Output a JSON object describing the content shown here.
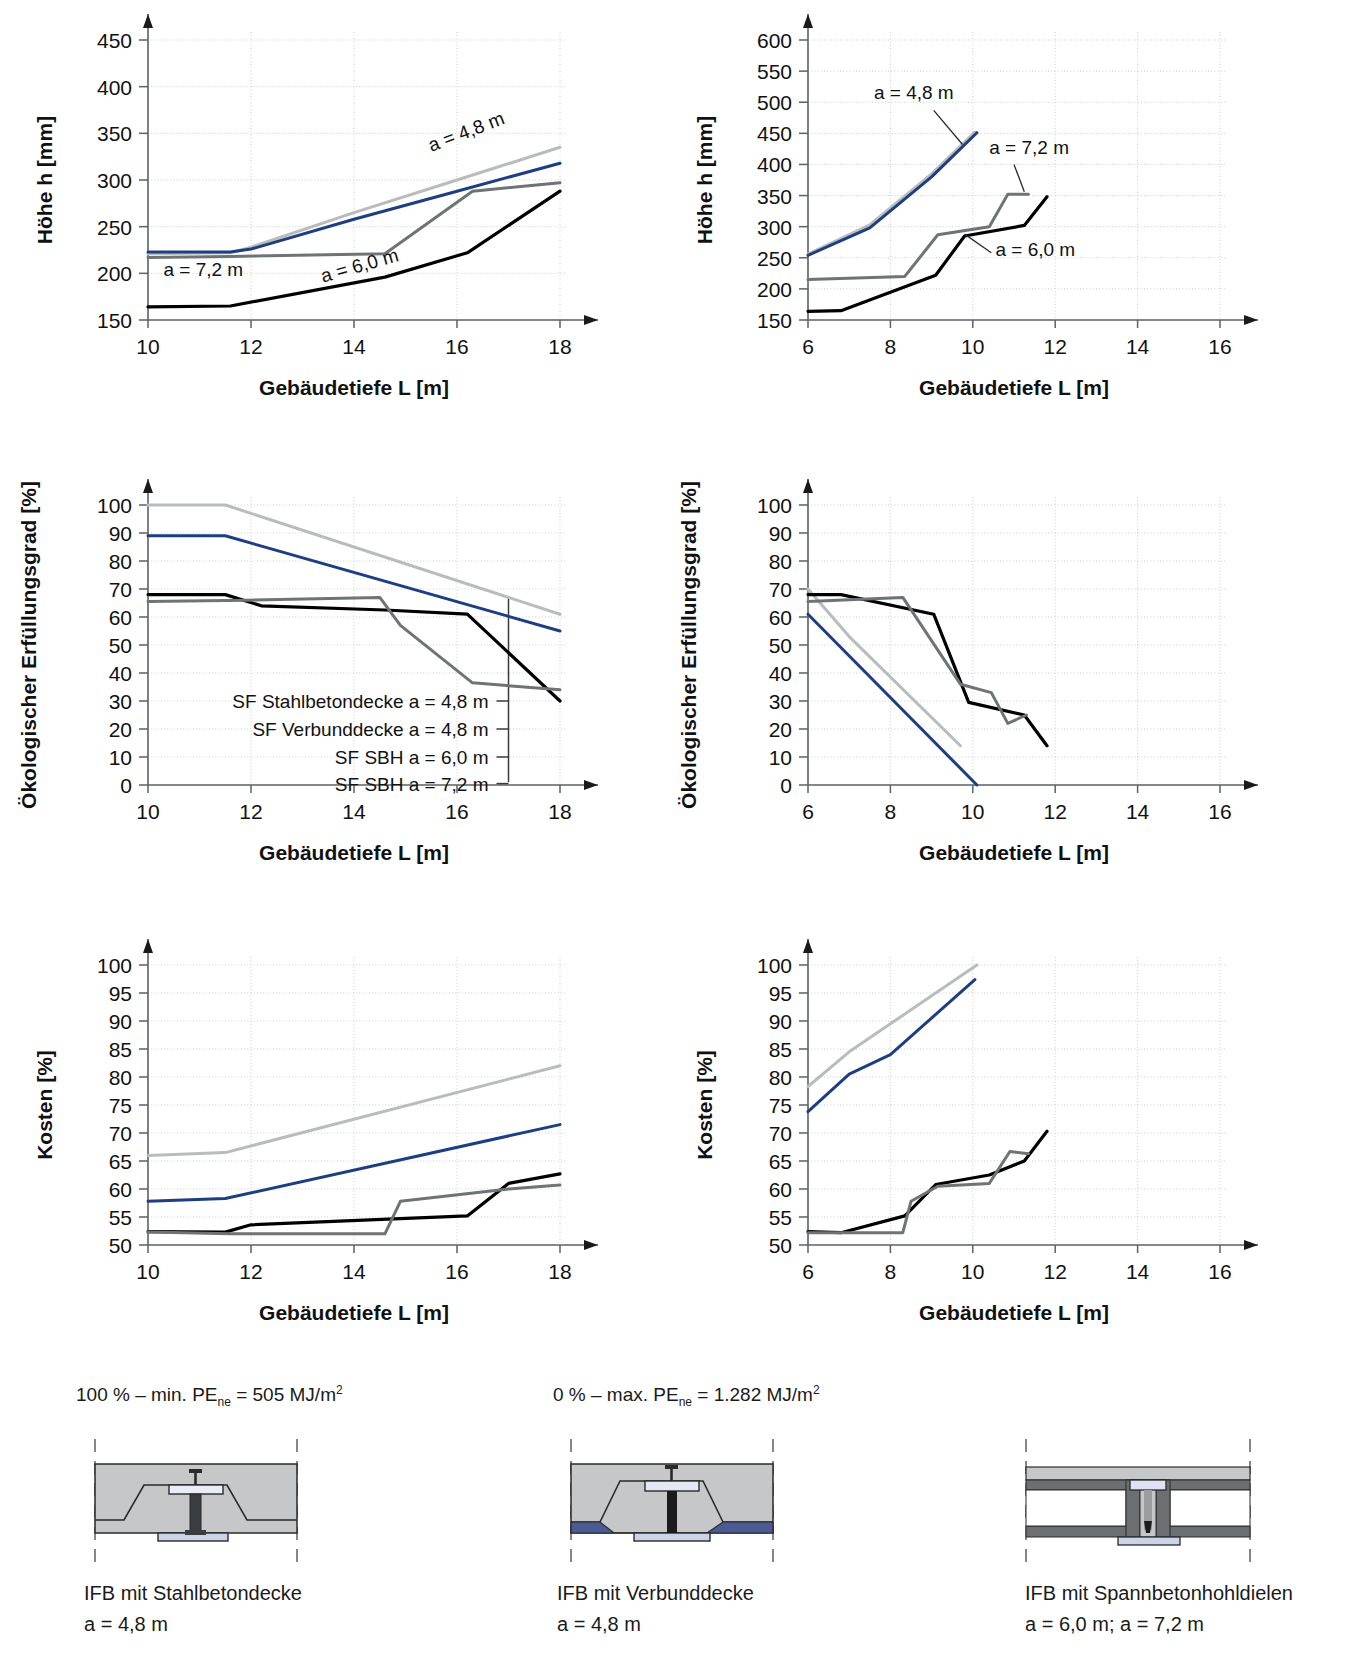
{
  "figure": {
    "notes": [
      {
        "text_html": "100 % &#8211; min. PE<sub>ne</sub> = 505 MJ/m<sup>2</sup>",
        "plain": "100% - min. PEne = 505 MJ/m2"
      },
      {
        "text_html": "0 % &#8211; max. PE<sub>ne</sub> = 1.282 MJ/m<sup>2</sup>",
        "plain": "0% - max. PEne = 1.282 MJ/m2"
      }
    ]
  },
  "colors": {
    "series_stahlbeton": "#b9bcbd",
    "series_verbund": "#1d3e80",
    "series_sbh60": "#000000",
    "series_sbh72": "#6e7375",
    "grid": "#c8cdd2",
    "axis": "#5c6164",
    "concrete": "#c6c7c9",
    "steel_dark": "#6b6f72",
    "composite_blue": "#4a5a92",
    "flange_blue": "#ccd3e8"
  },
  "legend": {
    "items": [
      {
        "label": "SF Stahlbetondecke a = 4,8 m"
      },
      {
        "label": "SF Verbunddecke a = 4,8 m"
      },
      {
        "label": "SF SBH a = 6,0 m"
      },
      {
        "label": "SF SBH a = 7,2 m"
      }
    ]
  },
  "chart_data": [
    {
      "id": "hoehe-links",
      "type": "line",
      "title": "",
      "xlabel": "Gebäudetiefe L [m]",
      "ylabel": "Höhe h [mm]",
      "xlim": [
        10,
        18
      ],
      "ylim": [
        150,
        450
      ],
      "xticks": [
        10,
        12,
        14,
        16,
        18
      ],
      "yticks": [
        150,
        200,
        250,
        300,
        350,
        400,
        450
      ],
      "grid": true,
      "annotations": [
        {
          "text": "a = 4,8 m",
          "x": 15.5,
          "y": 330,
          "rot": -21
        },
        {
          "text": "a = 7,2 m",
          "x": 10.3,
          "y": 197,
          "rot": 0
        },
        {
          "text": "a = 6,0 m",
          "x": 13.4,
          "y": 190,
          "rot": -16
        }
      ],
      "series": [
        {
          "name": "SF Stahlbetondecke a = 4,8 m",
          "color_key": "series_stahlbeton",
          "x": [
            10,
            11.6,
            12,
            14,
            16,
            18
          ],
          "values": [
            221,
            222,
            228,
            265,
            300,
            335
          ]
        },
        {
          "name": "SF Verbunddecke a = 4,8 m",
          "color_key": "series_verbund",
          "x": [
            10,
            11.6,
            12,
            14,
            16,
            18
          ],
          "values": [
            223,
            223,
            226,
            258,
            288,
            318
          ]
        },
        {
          "name": "SF SBH a = 7,2 m",
          "color_key": "series_sbh72",
          "x": [
            10,
            11.6,
            14.6,
            16.3,
            18
          ],
          "values": [
            217,
            218,
            221,
            288,
            297
          ]
        },
        {
          "name": "SF SBH a = 6,0 m",
          "color_key": "series_sbh60",
          "x": [
            10,
            11.6,
            14.6,
            16.2,
            18
          ],
          "values": [
            164,
            165,
            196,
            222,
            288
          ]
        }
      ]
    },
    {
      "id": "hoehe-rechts",
      "type": "line",
      "title": "",
      "xlabel": "Gebäudetiefe L [m]",
      "ylabel": "Höhe h [mm]",
      "xlim": [
        6,
        16
      ],
      "ylim": [
        150,
        600
      ],
      "xticks": [
        6,
        8,
        10,
        12,
        14,
        16
      ],
      "yticks": [
        150,
        200,
        250,
        300,
        350,
        400,
        450,
        500,
        550,
        600
      ],
      "grid": true,
      "annotations": [
        {
          "text": "a = 4,8 m",
          "x": 7.6,
          "y": 505,
          "rot": 0,
          "leader": [
            [
              9.05,
              487
            ],
            [
              9.75,
              432
            ]
          ]
        },
        {
          "text": "a = 7,2 m",
          "x": 10.4,
          "y": 417,
          "rot": 0,
          "leader": [
            [
              11.0,
              400
            ],
            [
              11.25,
              356
            ]
          ]
        },
        {
          "text": "a = 6,0 m",
          "x": 10.55,
          "y": 253,
          "rot": 0,
          "leader": [
            [
              10.45,
              258
            ],
            [
              9.8,
              288
            ]
          ]
        }
      ],
      "series": [
        {
          "name": "SF Stahlbetondecke a = 4,8 m",
          "color_key": "series_stahlbeton",
          "x": [
            6,
            7.5,
            9,
            10.05
          ],
          "values": [
            256,
            303,
            385,
            452
          ]
        },
        {
          "name": "SF Verbunddecke a = 4,8 m",
          "color_key": "series_verbund",
          "x": [
            6,
            7.5,
            9,
            10.1
          ],
          "values": [
            254,
            298,
            380,
            451
          ]
        },
        {
          "name": "SF SBH a = 7,2 m",
          "color_key": "series_sbh72",
          "x": [
            6,
            8.35,
            9.15,
            10.4,
            10.85,
            11.35
          ],
          "values": [
            215,
            220,
            287,
            300,
            352,
            352
          ]
        },
        {
          "name": "SF SBH a = 6,0 m",
          "color_key": "series_sbh60",
          "x": [
            6,
            6.8,
            9.1,
            9.8,
            11.25,
            11.8
          ],
          "values": [
            164,
            165,
            222,
            285,
            302,
            348
          ]
        }
      ]
    },
    {
      "id": "oeko-links",
      "type": "line",
      "title": "",
      "xlabel": "Gebäudetiefe L [m]",
      "ylabel": "Ökologischer Erfüllungsgrad [%]",
      "xlim": [
        10,
        18
      ],
      "ylim": [
        0,
        100
      ],
      "xticks": [
        10,
        12,
        14,
        16,
        18
      ],
      "yticks": [
        0,
        10,
        20,
        30,
        40,
        50,
        60,
        70,
        80,
        90,
        100
      ],
      "grid": true,
      "legend_bracket_x": 17.0,
      "series": [
        {
          "name": "SF Stahlbetondecke a = 4,8 m",
          "color_key": "series_stahlbeton",
          "x": [
            10,
            11.5,
            18
          ],
          "values": [
            100,
            100,
            61
          ]
        },
        {
          "name": "SF Verbunddecke a = 4,8 m",
          "color_key": "series_verbund",
          "x": [
            10,
            11.5,
            18
          ],
          "values": [
            89,
            89,
            55
          ]
        },
        {
          "name": "SF SBH a = 6,0 m",
          "color_key": "series_sbh60",
          "x": [
            10,
            11.5,
            12.2,
            14.6,
            16.2,
            18
          ],
          "values": [
            68,
            68,
            64,
            62.5,
            61,
            30
          ]
        },
        {
          "name": "SF SBH a = 7,2 m",
          "color_key": "series_sbh72",
          "x": [
            10,
            11.9,
            14.5,
            14.9,
            16.3,
            18
          ],
          "values": [
            65.5,
            66,
            67,
            57,
            36.5,
            34
          ]
        }
      ]
    },
    {
      "id": "oeko-rechts",
      "type": "line",
      "title": "",
      "xlabel": "Gebäudetiefe L [m]",
      "ylabel": "Ökologischer Erfüllungsgrad [%]",
      "xlim": [
        6,
        16
      ],
      "ylim": [
        0,
        100
      ],
      "xticks": [
        6,
        8,
        10,
        12,
        14,
        16
      ],
      "yticks": [
        0,
        10,
        20,
        30,
        40,
        50,
        60,
        70,
        80,
        90,
        100
      ],
      "grid": true,
      "series": [
        {
          "name": "SF Stahlbetondecke a = 4,8 m",
          "color_key": "series_stahlbeton",
          "x": [
            6,
            7,
            9.7
          ],
          "values": [
            70,
            53,
            14
          ]
        },
        {
          "name": "SF Verbunddecke a = 4,8 m",
          "color_key": "series_verbund",
          "x": [
            6,
            10.1
          ],
          "values": [
            61,
            0
          ]
        },
        {
          "name": "SF SBH a = 6,0 m",
          "color_key": "series_sbh60",
          "x": [
            6,
            6.8,
            9.05,
            9.9,
            11.25,
            11.8
          ],
          "values": [
            68,
            68,
            61,
            29.5,
            25,
            14
          ]
        },
        {
          "name": "SF SBH a = 7,2 m",
          "color_key": "series_sbh72",
          "x": [
            6,
            8.3,
            9.7,
            10.45,
            10.85,
            11.3
          ],
          "values": [
            65.5,
            67,
            36,
            33,
            22,
            25
          ]
        }
      ]
    },
    {
      "id": "kosten-links",
      "type": "line",
      "title": "",
      "xlabel": "Gebäudetiefe L [m]",
      "ylabel": "Kosten [%]",
      "xlim": [
        10,
        18
      ],
      "ylim": [
        50,
        100
      ],
      "xticks": [
        10,
        12,
        14,
        16,
        18
      ],
      "yticks": [
        50,
        55,
        60,
        65,
        70,
        75,
        80,
        85,
        90,
        95,
        100
      ],
      "grid": true,
      "series": [
        {
          "name": "SF Stahlbetondecke a = 4,8 m",
          "color_key": "series_stahlbeton",
          "x": [
            10,
            11.5,
            18
          ],
          "values": [
            66,
            66.5,
            82
          ]
        },
        {
          "name": "SF Verbunddecke a = 4,8 m",
          "color_key": "series_verbund",
          "x": [
            10,
            11.5,
            18
          ],
          "values": [
            57.8,
            58.3,
            71.5
          ]
        },
        {
          "name": "SF SBH a = 6,0 m",
          "color_key": "series_sbh60",
          "x": [
            10,
            11.5,
            12,
            16.2,
            17,
            18
          ],
          "values": [
            52.4,
            52.3,
            53.6,
            55.2,
            61,
            62.7
          ]
        },
        {
          "name": "SF SBH a = 7,2 m",
          "color_key": "series_sbh72",
          "x": [
            10,
            11.6,
            14.6,
            14.9,
            17,
            18
          ],
          "values": [
            52.3,
            52,
            52,
            57.8,
            60,
            60.7
          ]
        }
      ]
    },
    {
      "id": "kosten-rechts",
      "type": "line",
      "title": "",
      "xlabel": "Gebäudetiefe L [m]",
      "ylabel": "Kosten [%]",
      "xlim": [
        6,
        16
      ],
      "ylim": [
        50,
        100
      ],
      "xticks": [
        6,
        8,
        10,
        12,
        14,
        16
      ],
      "yticks": [
        50,
        55,
        60,
        65,
        70,
        75,
        80,
        85,
        90,
        95,
        100
      ],
      "grid": true,
      "series": [
        {
          "name": "SF Stahlbetondecke a = 4,8 m",
          "color_key": "series_stahlbeton",
          "x": [
            6,
            7,
            8,
            10.1
          ],
          "values": [
            78.3,
            84.5,
            89.5,
            100
          ]
        },
        {
          "name": "SF Verbunddecke a = 4,8 m",
          "color_key": "series_verbund",
          "x": [
            6,
            7,
            8,
            10.05
          ],
          "values": [
            73.8,
            80.5,
            84,
            97.4
          ]
        },
        {
          "name": "SF SBH a = 6,0 m",
          "color_key": "series_sbh60",
          "x": [
            6,
            6.8,
            8.35,
            9.1,
            10.4,
            11.25,
            11.8
          ],
          "values": [
            52.4,
            52.2,
            55.2,
            60.8,
            62.5,
            65,
            70.3
          ]
        },
        {
          "name": "SF SBH a = 7,2 m",
          "color_key": "series_sbh72",
          "x": [
            6,
            8.3,
            8.5,
            9.15,
            10.4,
            10.9,
            11.35
          ],
          "values": [
            52.2,
            52.2,
            57.8,
            60.5,
            61,
            66.7,
            66.3
          ]
        }
      ]
    }
  ],
  "diagrams": [
    {
      "id": "ifb-stahlbetondecke",
      "caption_line1": "IFB mit Stahlbetondecke",
      "caption_line2": "a = 4,8 m"
    },
    {
      "id": "ifb-verbunddecke",
      "caption_line1": "IFB mit Verbunddecke",
      "caption_line2": "a = 4,8 m"
    },
    {
      "id": "ifb-spannbetonhohldielen",
      "caption_line1": "IFB mit Spannbetonhohldielen",
      "caption_line2": "a = 6,0 m; a = 7,2 m"
    }
  ]
}
